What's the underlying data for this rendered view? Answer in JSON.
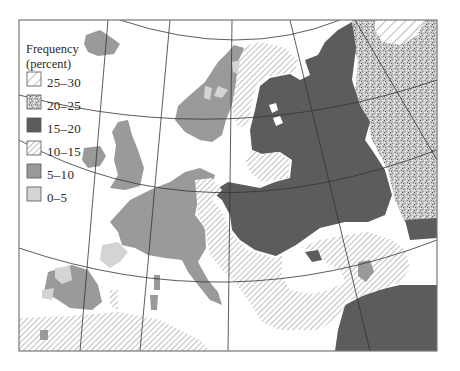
{
  "map": {
    "legend": {
      "title_line1": "Frequency",
      "title_line2": "(percent)",
      "items": [
        {
          "label": "25–30",
          "pattern": "diagonal-hatch-wide",
          "fill": "#ffffff"
        },
        {
          "label": "20–25",
          "pattern": "stipple",
          "fill": "#b8b8b8"
        },
        {
          "label": "15–20",
          "pattern": "solid",
          "fill": "#5c5c5c"
        },
        {
          "label": "10–15",
          "pattern": "diagonal-hatch-fine",
          "fill": "#ffffff"
        },
        {
          "label": "5–10",
          "pattern": "solid",
          "fill": "#9a9a9a"
        },
        {
          "label": "0–5",
          "pattern": "solid",
          "fill": "#d4d4d4"
        }
      ]
    },
    "colors": {
      "frame": "#777777",
      "sea": "#ffffff",
      "dark": "#5c5c5c",
      "medium": "#9a9a9a",
      "light": "#d4d4d4",
      "hatch": "#8a8a8a",
      "grid": "#333333"
    }
  }
}
